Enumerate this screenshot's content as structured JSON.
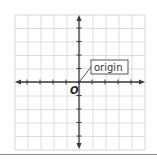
{
  "diagram": {
    "type": "coordinate-plane",
    "grid": {
      "columns": 10,
      "rows": 10,
      "left": 15,
      "top": 15,
      "cell_w": 13,
      "cell_h": 13.5,
      "line_color": "#d6d6d6",
      "border_color": "#c8c8c8"
    },
    "axes": {
      "color": "#3a3a3a",
      "origin_x": 79,
      "origin_y": 82,
      "tick_count_each_side": 4
    },
    "origin_label": "O",
    "callout": {
      "text": "origin",
      "border_color": "#555555",
      "text_color": "#333333"
    }
  }
}
